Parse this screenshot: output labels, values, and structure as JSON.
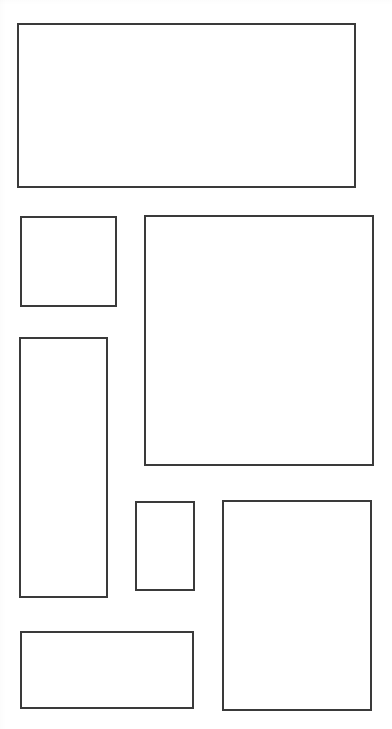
{
  "page": {
    "width": 392,
    "height": 729,
    "background_color": "#ffffff",
    "stroke_color": "#3a3a3a",
    "stroke_width": 2
  },
  "blocks": [
    {
      "name": "block-top-banner",
      "label": "",
      "x": 17,
      "y": 23,
      "width": 339,
      "height": 165,
      "stroke_color": "#3a3a3a",
      "stroke_width": 2,
      "fill_color": "#ffffff"
    },
    {
      "name": "block-upper-left-square",
      "label": "",
      "x": 20,
      "y": 216,
      "width": 97,
      "height": 91,
      "stroke_color": "#3a3a3a",
      "stroke_width": 2,
      "fill_color": "#ffffff"
    },
    {
      "name": "block-main-right-panel",
      "label": "",
      "x": 144,
      "y": 215,
      "width": 230,
      "height": 251,
      "stroke_color": "#3a3a3a",
      "stroke_width": 2,
      "fill_color": "#ffffff"
    },
    {
      "name": "block-left-tall-column",
      "label": "",
      "x": 19,
      "y": 337,
      "width": 89,
      "height": 261,
      "stroke_color": "#3a3a3a",
      "stroke_width": 2,
      "fill_color": "#ffffff"
    },
    {
      "name": "block-center-small-card",
      "label": "",
      "x": 135,
      "y": 501,
      "width": 60,
      "height": 90,
      "stroke_color": "#3a3a3a",
      "stroke_width": 2,
      "fill_color": "#ffffff"
    },
    {
      "name": "block-lower-right-panel",
      "label": "",
      "x": 222,
      "y": 500,
      "width": 150,
      "height": 211,
      "stroke_color": "#3a3a3a",
      "stroke_width": 2,
      "fill_color": "#ffffff"
    },
    {
      "name": "block-bottom-left-banner",
      "label": "",
      "x": 20,
      "y": 631,
      "width": 174,
      "height": 78,
      "stroke_color": "#3a3a3a",
      "stroke_width": 2,
      "fill_color": "#ffffff"
    }
  ]
}
